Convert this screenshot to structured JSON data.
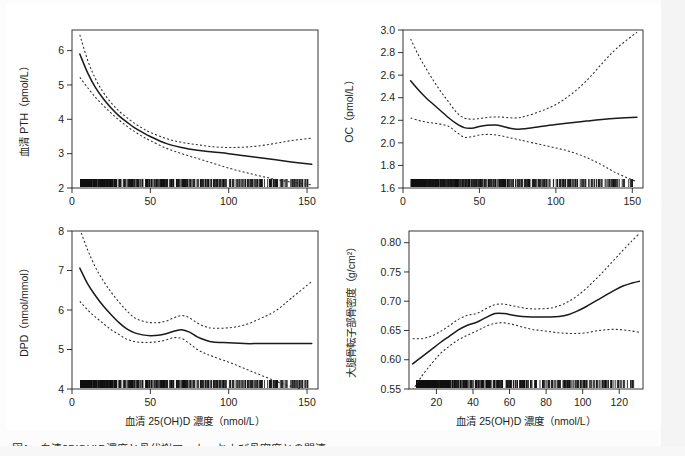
{
  "figure": {
    "caption": "図1　血清25(OH)D濃度と骨代謝マーカーおよび骨密度との関連",
    "background_color": "#ffffff",
    "line_color": "#1a1a1a",
    "ci_color": "#2b2b2b"
  },
  "chart_data": [
    {
      "id": "panel-pth",
      "type": "line",
      "position": "top-left",
      "title": "",
      "xlabel": "",
      "ylabel": "血清 PTH（pmol/L）",
      "xlim": [
        0,
        157
      ],
      "ylim": [
        2.0,
        6.6
      ],
      "xticks": [
        0,
        50,
        100,
        150
      ],
      "xtick_labels": [
        "0",
        "50",
        "100",
        "150"
      ],
      "yticks": [
        2,
        3,
        4,
        5,
        6
      ],
      "ytick_labels": [
        "2",
        "3",
        "4",
        "5",
        "6"
      ],
      "grid": false,
      "legend": "none",
      "rug": true,
      "series": [
        {
          "name": "fit",
          "style": "solid",
          "x": [
            5,
            10,
            15,
            20,
            25,
            30,
            35,
            40,
            45,
            50,
            60,
            70,
            80,
            90,
            100,
            110,
            120,
            130,
            140,
            153
          ],
          "y": [
            5.9,
            5.35,
            4.92,
            4.6,
            4.33,
            4.1,
            3.92,
            3.75,
            3.62,
            3.5,
            3.3,
            3.18,
            3.1,
            3.05,
            3.0,
            2.94,
            2.88,
            2.82,
            2.76,
            2.69
          ]
        },
        {
          "name": "upper_ci",
          "style": "dotted",
          "x": [
            5,
            10,
            15,
            20,
            25,
            30,
            35,
            40,
            45,
            50,
            60,
            70,
            80,
            90,
            100,
            110,
            120,
            130,
            140,
            153
          ],
          "y": [
            6.46,
            5.72,
            5.18,
            4.78,
            4.48,
            4.24,
            4.05,
            3.88,
            3.74,
            3.62,
            3.44,
            3.33,
            3.26,
            3.2,
            3.18,
            3.19,
            3.23,
            3.3,
            3.38,
            3.45
          ]
        },
        {
          "name": "lower_ci",
          "style": "dotted",
          "x": [
            5,
            10,
            15,
            20,
            25,
            30,
            35,
            40,
            45,
            50,
            60,
            70,
            80,
            90,
            100,
            110,
            120,
            130,
            140,
            153
          ],
          "y": [
            5.22,
            4.92,
            4.64,
            4.4,
            4.18,
            3.98,
            3.8,
            3.64,
            3.5,
            3.38,
            3.16,
            3.0,
            2.86,
            2.72,
            2.58,
            2.46,
            2.35,
            2.25,
            2.17,
            2.09
          ]
        }
      ]
    },
    {
      "id": "panel-oc",
      "type": "line",
      "position": "top-right",
      "title": "",
      "xlabel": "",
      "ylabel": "OC（pmol/L）",
      "xlim": [
        0,
        157
      ],
      "ylim": [
        1.6,
        3.0
      ],
      "xticks": [
        0,
        50,
        100,
        150
      ],
      "xtick_labels": [
        "0",
        "50",
        "100",
        "150"
      ],
      "yticks": [
        1.6,
        1.8,
        2.0,
        2.2,
        2.4,
        2.6,
        2.8,
        3.0
      ],
      "ytick_labels": [
        "1.6",
        "1.8",
        "2.0",
        "2.2",
        "2.4",
        "2.6",
        "2.8",
        "3.0"
      ],
      "grid": false,
      "legend": "none",
      "rug": true,
      "series": [
        {
          "name": "fit",
          "style": "solid",
          "x": [
            5,
            10,
            15,
            20,
            25,
            30,
            35,
            40,
            45,
            50,
            55,
            60,
            65,
            70,
            75,
            80,
            90,
            100,
            110,
            120,
            130,
            140,
            153
          ],
          "y": [
            2.55,
            2.47,
            2.4,
            2.34,
            2.28,
            2.22,
            2.17,
            2.135,
            2.13,
            2.145,
            2.155,
            2.158,
            2.148,
            2.13,
            2.12,
            2.125,
            2.145,
            2.163,
            2.178,
            2.193,
            2.207,
            2.218,
            2.228
          ]
        },
        {
          "name": "upper_ci",
          "style": "dotted",
          "x": [
            5,
            10,
            15,
            20,
            25,
            30,
            35,
            40,
            45,
            50,
            55,
            60,
            65,
            70,
            75,
            80,
            90,
            100,
            110,
            120,
            130,
            140,
            153
          ],
          "y": [
            2.92,
            2.78,
            2.66,
            2.55,
            2.45,
            2.36,
            2.27,
            2.22,
            2.21,
            2.215,
            2.225,
            2.23,
            2.228,
            2.222,
            2.222,
            2.235,
            2.28,
            2.34,
            2.43,
            2.55,
            2.7,
            2.84,
            2.98
          ]
        },
        {
          "name": "lower_ci",
          "style": "dotted",
          "x": [
            5,
            10,
            15,
            20,
            25,
            30,
            35,
            40,
            45,
            50,
            55,
            60,
            65,
            70,
            75,
            80,
            90,
            100,
            110,
            120,
            130,
            140,
            153
          ],
          "y": [
            2.22,
            2.2,
            2.185,
            2.175,
            2.165,
            2.145,
            2.095,
            2.05,
            2.055,
            2.07,
            2.075,
            2.072,
            2.06,
            2.045,
            2.03,
            2.015,
            1.985,
            1.955,
            1.92,
            1.87,
            1.805,
            1.73,
            1.655
          ]
        }
      ]
    },
    {
      "id": "panel-dpd",
      "type": "line",
      "position": "bottom-left",
      "title": "",
      "xlabel": "血清 25(OH)D 濃度（nmol/L）",
      "ylabel": "DPD（nmol/mmol）",
      "xlim": [
        0,
        157
      ],
      "ylim": [
        4.0,
        8.0
      ],
      "xticks": [
        0,
        50,
        100,
        150
      ],
      "xtick_labels": [
        "0",
        "50",
        "100",
        "150"
      ],
      "yticks": [
        4,
        5,
        6,
        7,
        8
      ],
      "ytick_labels": [
        "4",
        "5",
        "6",
        "7",
        "8"
      ],
      "grid": false,
      "legend": "none",
      "rug": true,
      "series": [
        {
          "name": "fit",
          "style": "solid",
          "x": [
            5,
            10,
            15,
            20,
            25,
            30,
            35,
            40,
            45,
            50,
            55,
            60,
            65,
            70,
            75,
            80,
            85,
            90,
            100,
            110,
            120,
            130,
            140,
            153
          ],
          "y": [
            7.06,
            6.66,
            6.36,
            6.1,
            5.88,
            5.68,
            5.52,
            5.42,
            5.37,
            5.35,
            5.36,
            5.4,
            5.46,
            5.5,
            5.44,
            5.32,
            5.24,
            5.19,
            5.17,
            5.15,
            5.15,
            5.15,
            5.15,
            5.15
          ]
        },
        {
          "name": "upper_ci",
          "style": "dotted",
          "x": [
            5,
            10,
            15,
            20,
            25,
            30,
            35,
            40,
            45,
            50,
            55,
            60,
            65,
            70,
            75,
            80,
            85,
            90,
            100,
            110,
            120,
            130,
            140,
            153
          ],
          "y": [
            8.05,
            7.52,
            7.08,
            6.74,
            6.45,
            6.2,
            5.98,
            5.8,
            5.72,
            5.68,
            5.68,
            5.72,
            5.8,
            5.86,
            5.8,
            5.67,
            5.58,
            5.54,
            5.55,
            5.62,
            5.78,
            5.98,
            6.3,
            6.72
          ]
        },
        {
          "name": "lower_ci",
          "style": "dotted",
          "x": [
            5,
            10,
            15,
            20,
            25,
            30,
            35,
            40,
            45,
            50,
            55,
            60,
            65,
            70,
            75,
            80,
            85,
            90,
            100,
            110,
            120,
            130,
            140,
            153
          ],
          "y": [
            6.22,
            6.0,
            5.82,
            5.66,
            5.5,
            5.38,
            5.26,
            5.2,
            5.18,
            5.18,
            5.2,
            5.24,
            5.3,
            5.28,
            5.15,
            5.0,
            4.9,
            4.82,
            4.68,
            4.52,
            4.36,
            4.2,
            4.06,
            3.95
          ]
        }
      ]
    },
    {
      "id": "panel-bmd",
      "type": "line",
      "position": "bottom-right",
      "title": "",
      "xlabel": "血清 25(OH)D 濃度（nmol/L）",
      "ylabel": "大腿骨転子部骨密度（g/cm²）",
      "xlim": [
        5,
        133
      ],
      "ylim": [
        0.55,
        0.82
      ],
      "xticks": [
        20,
        40,
        60,
        80,
        100,
        120
      ],
      "xtick_labels": [
        "20",
        "40",
        "60",
        "80",
        "100",
        "120"
      ],
      "yticks": [
        0.55,
        0.6,
        0.65,
        0.7,
        0.75,
        0.8
      ],
      "ytick_labels": [
        "0.55",
        "0.60",
        "0.65",
        "0.70",
        "0.75",
        "0.80"
      ],
      "grid": false,
      "legend": "none",
      "rug": true,
      "series": [
        {
          "name": "fit",
          "style": "solid",
          "x": [
            7,
            12,
            17,
            22,
            27,
            32,
            37,
            42,
            47,
            52,
            57,
            62,
            67,
            72,
            77,
            82,
            87,
            92,
            97,
            102,
            107,
            112,
            117,
            122,
            127,
            131
          ],
          "y": [
            0.593,
            0.605,
            0.617,
            0.629,
            0.64,
            0.651,
            0.659,
            0.664,
            0.672,
            0.679,
            0.679,
            0.676,
            0.674,
            0.673,
            0.673,
            0.673,
            0.674,
            0.677,
            0.683,
            0.691,
            0.7,
            0.709,
            0.718,
            0.726,
            0.731,
            0.734
          ]
        },
        {
          "name": "upper_ci",
          "style": "dotted",
          "x": [
            7,
            12,
            17,
            22,
            27,
            32,
            37,
            42,
            47,
            52,
            57,
            62,
            67,
            72,
            77,
            82,
            87,
            92,
            97,
            102,
            107,
            112,
            117,
            122,
            127,
            131
          ],
          "y": [
            0.636,
            0.636,
            0.64,
            0.648,
            0.658,
            0.669,
            0.676,
            0.679,
            0.687,
            0.694,
            0.695,
            0.692,
            0.689,
            0.687,
            0.687,
            0.688,
            0.692,
            0.699,
            0.709,
            0.722,
            0.737,
            0.753,
            0.77,
            0.787,
            0.803,
            0.816
          ]
        },
        {
          "name": "lower_ci",
          "style": "dotted",
          "x": [
            7,
            12,
            17,
            22,
            27,
            32,
            37,
            42,
            47,
            52,
            57,
            62,
            67,
            72,
            77,
            82,
            87,
            92,
            97,
            102,
            107,
            112,
            117,
            122,
            127,
            131
          ],
          "y": [
            0.548,
            0.572,
            0.592,
            0.61,
            0.623,
            0.634,
            0.642,
            0.649,
            0.657,
            0.662,
            0.663,
            0.66,
            0.656,
            0.652,
            0.65,
            0.648,
            0.646,
            0.645,
            0.645,
            0.646,
            0.649,
            0.651,
            0.652,
            0.651,
            0.649,
            0.647
          ]
        }
      ]
    }
  ]
}
